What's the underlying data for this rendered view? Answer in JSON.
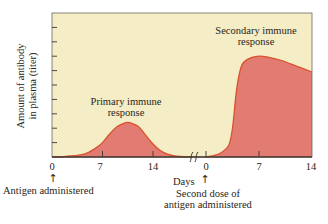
{
  "chart_data": {
    "type": "area",
    "title": "",
    "ylabel": "Amount of antibody in plasma (titer)",
    "ylabel_lines": [
      "Amount of antibody",
      "in plasma (titer)"
    ],
    "xlabel": "Days",
    "y_ticks_count": 9,
    "y_tick_labels": [],
    "ylim": [
      0,
      100
    ],
    "grid": false,
    "legend": null,
    "axis_break": true,
    "panels": [
      {
        "name": "Primary immune response",
        "label_lines": [
          "Primary immune",
          "response"
        ],
        "x_tick_labels": [
          "0",
          "7",
          "14"
        ],
        "x": [
          0,
          2,
          4,
          5,
          6,
          7,
          8,
          9,
          10,
          10.5,
          11,
          12,
          13,
          14,
          15,
          16,
          17,
          19.5
        ],
        "values": [
          0,
          0.5,
          1.5,
          3,
          6,
          10,
          16,
          21,
          23.5,
          24,
          23.5,
          21,
          15,
          9,
          4.5,
          2,
          0.8,
          0
        ],
        "annotation": "Antigen administered",
        "annotation_x": 0
      },
      {
        "name": "Secondary immune response",
        "label_lines": [
          "Secondary immune",
          "response"
        ],
        "x_tick_labels": [
          "0",
          "7",
          "14"
        ],
        "x": [
          0,
          1,
          2,
          3,
          3.5,
          4,
          4.5,
          5,
          6,
          7,
          8,
          10,
          12,
          14
        ],
        "values": [
          0,
          1,
          3,
          8,
          20,
          45,
          60,
          66,
          69,
          70,
          69.5,
          67,
          63,
          59
        ],
        "annotation": "Second dose of antigen administered",
        "annotation_lines": [
          "Second dose of",
          "antigen administered"
        ],
        "annotation_x": 0
      }
    ]
  },
  "colors": {
    "background": "#ffffff",
    "plot_bg": "#f4edc6",
    "fill": "#e27b72",
    "outline": "#d9512c",
    "frame": "#6b6862",
    "text": "#2a2620"
  },
  "labels": {
    "primary_line1": "Primary immune",
    "primary_line2": "response",
    "secondary_line1": "Secondary immune",
    "secondary_line2": "response",
    "xlabel": "Days",
    "ylabel_line1": "Amount of antibody",
    "ylabel_line2": "in plasma (titer)",
    "antigen": "Antigen administered",
    "second_dose_line1": "Second dose of",
    "second_dose_line2": "antigen administered",
    "arrow": "↑",
    "break_mark": "ʃʃ"
  },
  "ticks": {
    "p1_0": "0",
    "p1_7": "7",
    "p1_14": "14",
    "p2_0": "0",
    "p2_7": "7",
    "p2_14": "14"
  }
}
